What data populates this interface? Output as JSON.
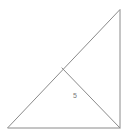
{
  "figure": {
    "kind": "geometry-diagram",
    "shape_name": "right-triangle-with-cevian",
    "width": 128,
    "height": 136,
    "background_color": "#ffffff",
    "stroke_color": "#8a8a8a",
    "stroke_width": 1,
    "label_color": "#7a7a7a",
    "vertices": {
      "bottom_left": {
        "x": 8,
        "y": 128
      },
      "bottom_right": {
        "x": 120,
        "y": 128
      },
      "top_right": {
        "x": 120,
        "y": 10
      },
      "hypotenuse_point": {
        "x": 62,
        "y": 68
      }
    },
    "edges": [
      {
        "name": "base",
        "from": "bottom_left",
        "to": "bottom_right"
      },
      {
        "name": "right-side",
        "from": "bottom_right",
        "to": "top_right"
      },
      {
        "name": "hypotenuse",
        "from": "top_right",
        "to": "bottom_left"
      },
      {
        "name": "cevian",
        "from": "hypotenuse_point",
        "to": "bottom_right"
      }
    ],
    "labels": [
      {
        "id": "cevian-length",
        "text": "5",
        "x": 75,
        "y": 96
      }
    ]
  }
}
